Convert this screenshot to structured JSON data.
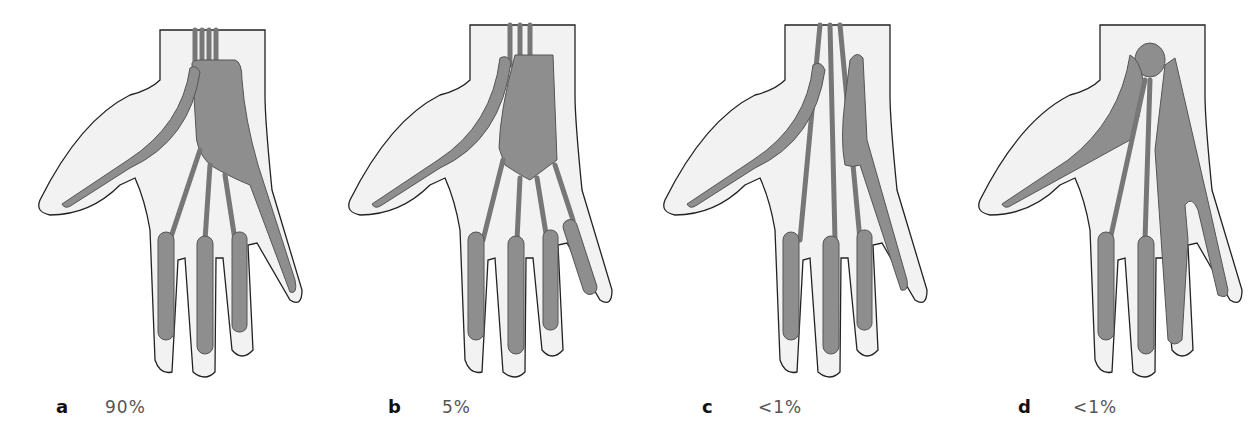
{
  "figure": {
    "colors": {
      "skin": "#f2f2f2",
      "sheath": "#8e8e8e",
      "outline": "#222222",
      "tendon": "#777777"
    },
    "panels": [
      {
        "letter": "a",
        "percentage": "90%",
        "variant": "ulnar bursa continuous with little finger sheath; thumb sheath separate"
      },
      {
        "letter": "b",
        "percentage": "5%",
        "variant": "ulnar bursa not continuous with any digital sheath"
      },
      {
        "letter": "c",
        "percentage": "<1%",
        "variant": "narrow ulnar bursa continuous with little finger sheath"
      },
      {
        "letter": "d",
        "percentage": "<1%",
        "variant": "ulnar bursa continuous with ring and little finger sheaths; radial bursa communicating"
      }
    ]
  }
}
